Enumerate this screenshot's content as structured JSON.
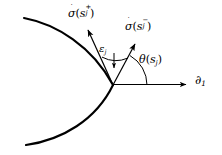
{
  "figure": {
    "type": "geometric-diagram",
    "background_color": "#ffffff",
    "stroke_color": "#000000",
    "labels": {
      "tangent_right": {
        "name": "sigma-dot-s-j-plus",
        "base": "σ",
        "dot": "˙",
        "open": "(",
        "arg": "s",
        "sub": "j",
        "sup": "+",
        "close": ")"
      },
      "tangent_left": {
        "name": "sigma-dot-s-j-minus",
        "base": "σ",
        "dot": "˙",
        "open": "(",
        "arg": "s",
        "sub": "j",
        "sup": "−",
        "close": ")"
      },
      "exterior_angle": {
        "name": "epsilon-j",
        "base": "ε",
        "sub": "j"
      },
      "tangent_angle": {
        "name": "theta-s-j",
        "base": "θ",
        "open": "(",
        "arg": "s",
        "sub": "j",
        "close": ")"
      },
      "axis": {
        "name": "partial-1",
        "base": "∂",
        "sub": "1"
      }
    },
    "geometry": {
      "vertex": [
        113,
        85
      ],
      "axis_arrow_end": [
        190,
        84
      ],
      "tangent_right_arrow_end": [
        86,
        27
      ],
      "tangent_left_arrow_end": [
        137,
        41
      ],
      "epsilon_arc_radius": 30,
      "theta_arc_radius": 34
    }
  }
}
